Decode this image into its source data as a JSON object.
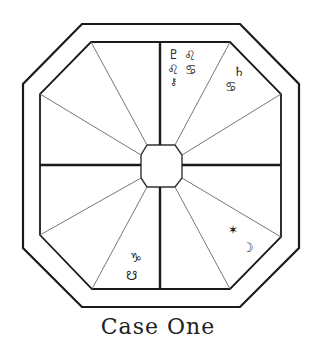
{
  "caption": "Case One",
  "colors": {
    "line": "#1a1a1a",
    "thin_line": "#666666",
    "background": "#ffffff"
  },
  "houses": {
    "top_right": {
      "glyphs": [
        "♇",
        "♌",
        "♌",
        "♋",
        "⚷"
      ]
    },
    "upper_right": {
      "glyphs": [
        "♄",
        "♋"
      ]
    },
    "lower_right": {
      "glyphs": [
        "✶",
        "☽"
      ]
    },
    "bottom_left": {
      "glyphs": [
        "♑",
        "☋"
      ]
    }
  }
}
